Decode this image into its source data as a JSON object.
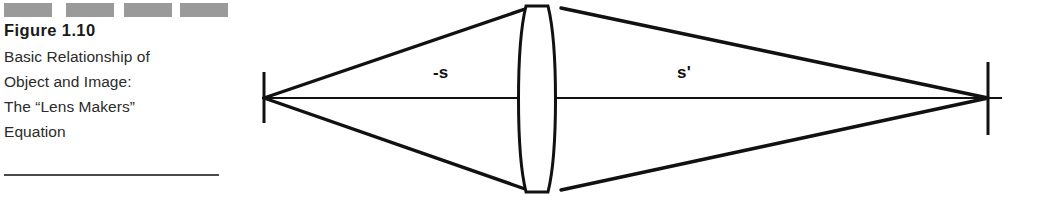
{
  "caption": {
    "dashes": [
      "dash-1",
      "dash-2",
      "dash-3",
      "dash-4"
    ],
    "figure_number": "Figure 1.10",
    "lines": [
      "Basic Relationship of",
      "Object and Image:",
      "The “Lens Makers”",
      "Equation"
    ],
    "rule": "caption-divider"
  },
  "diagram": {
    "title": "Basic Relationship of Object and Image: The “Lens Makers” Equation",
    "labels": {
      "object_distance": "-s",
      "image_distance": "s'"
    },
    "elements": {
      "optical_axis": "optical-axis",
      "object_tick": "object-point-tick",
      "image_tick": "image-point-tick",
      "lens": "biconvex-lens",
      "rays_left": "object-ray-cone",
      "rays_right": "image-ray-cone"
    },
    "colors": {
      "ink": "#111111",
      "dash_gray": "#9a9a9a",
      "rule_gray": "#4a4a4a",
      "background": "#ffffff"
    },
    "geometry": {
      "axis_y": 98,
      "object_point_x": 264,
      "image_point_x": 988,
      "lens_center_x": 538,
      "lens_top_y": 5,
      "lens_bottom_y": 193,
      "lens_edge_left_x": 521,
      "lens_edge_right_x": 556
    }
  }
}
